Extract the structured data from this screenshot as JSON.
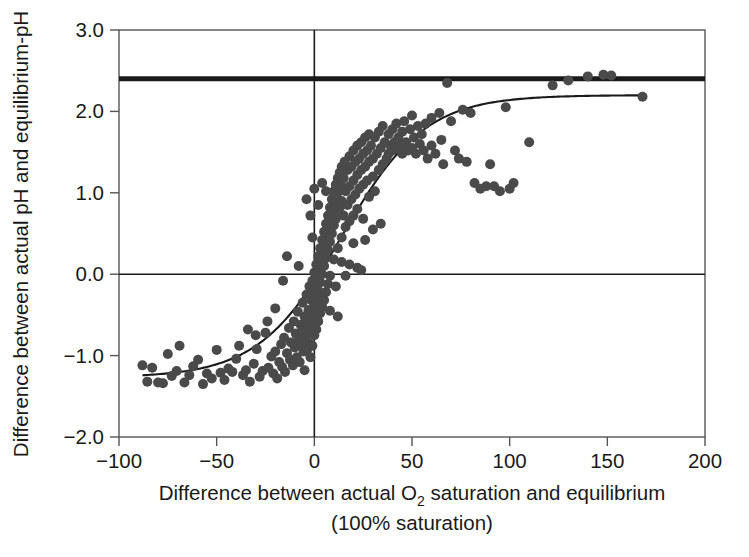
{
  "figure": {
    "background_color": "#ffffff",
    "ink_color": "#1a1a1a",
    "point_color": "#4a4a4a",
    "frame_color": "#555555"
  },
  "axis_labels": {
    "y_title": "Difference between actual pH and equilibrium-pH",
    "x_title_part1": "Difference between actual O",
    "x_title_sub": "2",
    "x_title_part2": " saturation and equilibrium",
    "x_title_line2": "(100% saturation)"
  },
  "chart_data": {
    "type": "scatter",
    "title": "",
    "xlabel": "Difference between actual O2 saturation and equilibrium (100% saturation)",
    "ylabel": "Difference between actual pH and equilibrium-pH",
    "xlim": [
      -100,
      200
    ],
    "ylim": [
      -2.0,
      3.0
    ],
    "xticks": [
      -100,
      -50,
      0,
      50,
      100,
      150,
      200
    ],
    "xticklabels": [
      "−100",
      "−50",
      "0",
      "50",
      "100",
      "150",
      "200"
    ],
    "yticks": [
      -2.0,
      -1.0,
      0.0,
      1.0,
      2.0,
      3.0
    ],
    "yticklabels": [
      "−2.0",
      "−1.0",
      "0.0",
      "1.0",
      "2.0",
      "3.0"
    ],
    "grid": false,
    "legend": "none",
    "reference_lines": [
      {
        "name": "upper-bound-line",
        "orientation": "horizontal",
        "y": 2.4,
        "style": "thick",
        "width": 5
      },
      {
        "name": "zero-pH-line",
        "orientation": "horizontal",
        "y": 0.0,
        "style": "thin",
        "width": 1.6
      },
      {
        "name": "zero-saturation-line",
        "orientation": "vertical",
        "x": 0,
        "style": "thin",
        "width": 1.6
      }
    ],
    "fit_curve": {
      "name": "sigmoid-fit",
      "form": "logistic",
      "lower_asymptote": -1.27,
      "upper_asymptote": 2.2,
      "midpoint_x": 14,
      "slope_k": 0.047,
      "x_start": -88,
      "x_end": 170
    },
    "series": [
      {
        "name": "observations",
        "marker": "circle",
        "color": "#4a4a4a",
        "size": 10,
        "points": [
          [
            -88.0,
            -1.12
          ],
          [
            -85.5,
            -1.32
          ],
          [
            -83.0,
            -1.15
          ],
          [
            -80.0,
            -1.33
          ],
          [
            -77.5,
            -1.34
          ],
          [
            -75.0,
            -0.98
          ],
          [
            -73.0,
            -1.25
          ],
          [
            -70.5,
            -1.19
          ],
          [
            -69.0,
            -0.88
          ],
          [
            -66.5,
            -1.33
          ],
          [
            -64.0,
            -1.24
          ],
          [
            -62.0,
            -1.13
          ],
          [
            -59.5,
            -1.05
          ],
          [
            -57.0,
            -1.35
          ],
          [
            -55.0,
            -1.22
          ],
          [
            -52.5,
            -1.28
          ],
          [
            -50.0,
            -0.93
          ],
          [
            -48.0,
            -1.21
          ],
          [
            -46.0,
            -1.3
          ],
          [
            -44.0,
            -1.16
          ],
          [
            -42.0,
            -1.2
          ],
          [
            -40.0,
            -1.04
          ],
          [
            -38.5,
            -0.88
          ],
          [
            -36.5,
            -1.24
          ],
          [
            -35.0,
            -1.18
          ],
          [
            -33.0,
            -1.32
          ],
          [
            -31.0,
            -1.1
          ],
          [
            -29.5,
            -0.92
          ],
          [
            -28.0,
            -1.26
          ],
          [
            -26.5,
            -1.19
          ],
          [
            -25.0,
            -0.72
          ],
          [
            -23.5,
            -1.15
          ],
          [
            -22.0,
            -1.01
          ],
          [
            -21.0,
            -1.22
          ],
          [
            -20.0,
            -0.95
          ],
          [
            -19.0,
            -1.28
          ],
          [
            -18.0,
            -1.08
          ],
          [
            -17.0,
            -0.86
          ],
          [
            -16.5,
            -1.14
          ],
          [
            -15.5,
            -0.78
          ],
          [
            -15.0,
            -1.2
          ],
          [
            -14.0,
            -0.97
          ],
          [
            -13.0,
            -0.66
          ],
          [
            -12.5,
            -1.05
          ],
          [
            -12.0,
            -0.84
          ],
          [
            -11.0,
            -1.12
          ],
          [
            -10.5,
            -0.58
          ],
          [
            -10.0,
            -0.9
          ],
          [
            -9.5,
            -0.73
          ],
          [
            -9.0,
            -1.02
          ],
          [
            -8.5,
            -0.46
          ],
          [
            -8.0,
            -0.8
          ],
          [
            -7.5,
            -1.08
          ],
          [
            -7.0,
            -0.62
          ],
          [
            -6.5,
            -0.88
          ],
          [
            -6.0,
            -0.35
          ],
          [
            -6.0,
            -0.7
          ],
          [
            -5.5,
            -0.95
          ],
          [
            -5.0,
            -0.52
          ],
          [
            -5.0,
            -1.18
          ],
          [
            -4.5,
            -0.78
          ],
          [
            -4.0,
            -0.25
          ],
          [
            -4.0,
            -0.62
          ],
          [
            -3.5,
            -0.92
          ],
          [
            -3.0,
            -0.44
          ],
          [
            -3.0,
            -0.72
          ],
          [
            -2.5,
            -0.15
          ],
          [
            -2.5,
            -0.85
          ],
          [
            -2.0,
            -0.55
          ],
          [
            -2.0,
            -1.02
          ],
          [
            -1.5,
            -0.32
          ],
          [
            -1.5,
            -0.68
          ],
          [
            -1.0,
            -0.08
          ],
          [
            -1.0,
            -0.48
          ],
          [
            -1.0,
            -0.88
          ],
          [
            -0.5,
            -0.25
          ],
          [
            -0.5,
            -0.62
          ],
          [
            0.0,
            0.02
          ],
          [
            0.0,
            -0.38
          ],
          [
            0.0,
            -0.75
          ],
          [
            0.5,
            -0.18
          ],
          [
            0.5,
            -0.55
          ],
          [
            1.0,
            0.12
          ],
          [
            1.0,
            -0.3
          ],
          [
            1.0,
            -0.68
          ],
          [
            1.5,
            -0.05
          ],
          [
            1.5,
            -0.45
          ],
          [
            2.0,
            0.22
          ],
          [
            2.0,
            -0.2
          ],
          [
            2.0,
            -0.58
          ],
          [
            2.5,
            0.05
          ],
          [
            2.5,
            -0.35
          ],
          [
            3.0,
            0.32
          ],
          [
            3.0,
            -0.1
          ],
          [
            3.0,
            -0.48
          ],
          [
            3.5,
            0.18
          ],
          [
            3.5,
            -0.28
          ],
          [
            4.0,
            0.42
          ],
          [
            4.0,
            0.0
          ],
          [
            4.0,
            -0.4
          ],
          [
            4.5,
            0.28
          ],
          [
            5.0,
            0.52
          ],
          [
            5.0,
            0.1
          ],
          [
            5.0,
            -0.32
          ],
          [
            5.5,
            0.38
          ],
          [
            6.0,
            0.62
          ],
          [
            6.0,
            0.2
          ],
          [
            6.0,
            -0.22
          ],
          [
            6.5,
            0.48
          ],
          [
            7.0,
            0.72
          ],
          [
            7.0,
            0.3
          ],
          [
            7.0,
            -0.12
          ],
          [
            7.5,
            0.58
          ],
          [
            8.0,
            0.82
          ],
          [
            8.0,
            0.4
          ],
          [
            8.0,
            -0.02
          ],
          [
            8.5,
            0.68
          ],
          [
            9.0,
            0.92
          ],
          [
            9.0,
            0.5
          ],
          [
            9.5,
            0.78
          ],
          [
            10.0,
            1.02
          ],
          [
            10.0,
            0.6
          ],
          [
            10.0,
            0.18
          ],
          [
            10.5,
            0.88
          ],
          [
            11.0,
            1.1
          ],
          [
            11.0,
            0.68
          ],
          [
            11.5,
            0.95
          ],
          [
            12.0,
            1.18
          ],
          [
            12.0,
            0.75
          ],
          [
            12.0,
            0.32
          ],
          [
            12.5,
            1.02
          ],
          [
            13.0,
            1.25
          ],
          [
            13.0,
            0.82
          ],
          [
            13.5,
            1.1
          ],
          [
            14.0,
            1.32
          ],
          [
            14.0,
            0.9
          ],
          [
            14.0,
            0.45
          ],
          [
            15.0,
            1.18
          ],
          [
            15.0,
            0.72
          ],
          [
            15.5,
            1.38
          ],
          [
            16.0,
            1.02
          ],
          [
            16.0,
            0.58
          ],
          [
            17.0,
            1.28
          ],
          [
            17.0,
            0.85
          ],
          [
            18.0,
            1.45
          ],
          [
            18.0,
            1.08
          ],
          [
            18.0,
            0.65
          ],
          [
            19.0,
            1.32
          ],
          [
            19.0,
            0.92
          ],
          [
            20.0,
            1.52
          ],
          [
            20.0,
            1.15
          ],
          [
            20.0,
            0.72
          ],
          [
            21.0,
            1.38
          ],
          [
            21.0,
            0.98
          ],
          [
            22.0,
            1.58
          ],
          [
            22.0,
            1.22
          ],
          [
            22.0,
            0.8
          ],
          [
            23.0,
            1.42
          ],
          [
            23.0,
            1.05
          ],
          [
            24.0,
            1.62
          ],
          [
            24.0,
            1.28
          ],
          [
            25.0,
            1.48
          ],
          [
            25.0,
            1.1
          ],
          [
            25.0,
            0.68
          ],
          [
            26.0,
            1.68
          ],
          [
            26.0,
            1.32
          ],
          [
            27.0,
            1.52
          ],
          [
            27.0,
            1.15
          ],
          [
            28.0,
            1.72
          ],
          [
            28.0,
            1.38
          ],
          [
            28.0,
            0.95
          ],
          [
            29.0,
            1.58
          ],
          [
            30.0,
            1.42
          ],
          [
            30.0,
            1.2
          ],
          [
            31.0,
            1.68
          ],
          [
            31.0,
            1.02
          ],
          [
            32.0,
            1.48
          ],
          [
            33.0,
            1.75
          ],
          [
            33.0,
            1.28
          ],
          [
            34.0,
            1.55
          ],
          [
            35.0,
            1.82
          ],
          [
            35.0,
            1.35
          ],
          [
            36.0,
            1.62
          ],
          [
            37.0,
            1.42
          ],
          [
            38.0,
            1.72
          ],
          [
            38.0,
            1.48
          ],
          [
            39.0,
            1.58
          ],
          [
            40.0,
            1.78
          ],
          [
            40.0,
            1.52
          ],
          [
            41.0,
            1.62
          ],
          [
            42.0,
            1.85
          ],
          [
            42.0,
            1.55
          ],
          [
            43.0,
            1.68
          ],
          [
            44.0,
            1.58
          ],
          [
            45.0,
            1.75
          ],
          [
            45.0,
            1.48
          ],
          [
            46.0,
            1.88
          ],
          [
            47.0,
            1.62
          ],
          [
            48.0,
            1.52
          ],
          [
            49.0,
            1.78
          ],
          [
            50.0,
            1.95
          ],
          [
            50.0,
            1.55
          ],
          [
            51.0,
            1.68
          ],
          [
            52.0,
            1.48
          ],
          [
            53.0,
            1.82
          ],
          [
            54.0,
            1.6
          ],
          [
            55.0,
            1.72
          ],
          [
            56.0,
            1.52
          ],
          [
            57.0,
            1.85
          ],
          [
            58.0,
            1.42
          ],
          [
            60.0,
            1.92
          ],
          [
            60.0,
            1.58
          ],
          [
            62.0,
            1.48
          ],
          [
            64.0,
            1.98
          ],
          [
            65.0,
            1.65
          ],
          [
            66.0,
            1.35
          ],
          [
            68.0,
            2.35
          ],
          [
            70.0,
            1.88
          ],
          [
            72.0,
            1.52
          ],
          [
            74.0,
            1.42
          ],
          [
            76.0,
            2.02
          ],
          [
            78.0,
            1.38
          ],
          [
            80.0,
            1.98
          ],
          [
            82.0,
            1.12
          ],
          [
            85.0,
            1.05
          ],
          [
            88.0,
            1.08
          ],
          [
            90.0,
            1.35
          ],
          [
            92.0,
            1.08
          ],
          [
            95.0,
            1.02
          ],
          [
            98.0,
            2.05
          ],
          [
            100.0,
            1.05
          ],
          [
            102.0,
            1.12
          ],
          [
            110.0,
            1.62
          ],
          [
            122.0,
            2.32
          ],
          [
            130.0,
            2.38
          ],
          [
            140.0,
            2.43
          ],
          [
            148.0,
            2.45
          ],
          [
            152.0,
            2.44
          ],
          [
            168.0,
            2.18
          ],
          [
            -2.0,
            0.72
          ],
          [
            -14.0,
            0.22
          ],
          [
            -16.0,
            -0.08
          ],
          [
            2.0,
            0.85
          ],
          [
            -8.0,
            0.1
          ],
          [
            6.0,
            1.02
          ],
          [
            -1.0,
            0.45
          ],
          [
            14.0,
            0.15
          ],
          [
            18.0,
            0.12
          ],
          [
            22.0,
            0.08
          ],
          [
            16.0,
            -0.02
          ],
          [
            24.0,
            0.05
          ],
          [
            11.0,
            -0.15
          ],
          [
            8.0,
            -0.45
          ],
          [
            20.0,
            0.38
          ],
          [
            26.0,
            0.42
          ],
          [
            30.0,
            0.55
          ],
          [
            34.0,
            0.62
          ],
          [
            12.0,
            -0.52
          ],
          [
            -20.0,
            -0.42
          ],
          [
            -24.0,
            -0.58
          ],
          [
            -30.0,
            -0.75
          ],
          [
            -34.0,
            -0.68
          ],
          [
            4.0,
            1.12
          ],
          [
            0.0,
            1.05
          ],
          [
            -4.0,
            0.92
          ]
        ]
      }
    ]
  }
}
